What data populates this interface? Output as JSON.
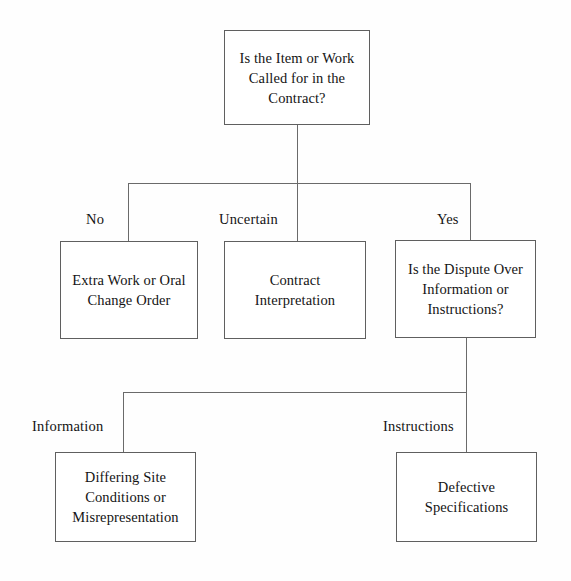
{
  "diagram": {
    "title_text": "Is the Item or Work Called for in the Contract?",
    "nodes": {
      "root": "Is the Item or Work\nCalled for in the\nContract?",
      "extra_work": "Extra Work or Oral\nChange Order",
      "contract_interpretation": "Contract\nInterpretation",
      "dispute_question": "Is the Dispute Over\nInformation or\nInstructions?",
      "differing_site": "Differing Site\nConditions or\nMisrepresentation",
      "defective_specs": "Defective\nSpecifications"
    },
    "edge_labels": {
      "no": "No",
      "uncertain": "Uncertain",
      "yes": "Yes",
      "information": "Information",
      "instructions": "Instructions"
    },
    "colors": {
      "background": "#fefefe",
      "box_border": "#5f5f5f",
      "box_fill": "#ffffff",
      "line": "#6a6a6a",
      "text": "#141414"
    }
  }
}
